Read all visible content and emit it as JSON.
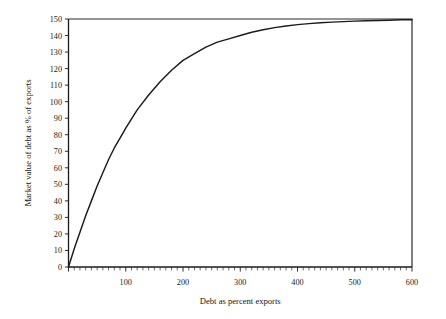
{
  "chart_data": {
    "type": "line",
    "title": "",
    "xlabel": "Debt as percent exports",
    "ylabel": "Market value of debt as % of exports",
    "xlim": [
      0,
      600
    ],
    "ylim": [
      0,
      150
    ],
    "grid": false,
    "legend_position": "none",
    "x_ticks": [
      0,
      100,
      200,
      300,
      400,
      500,
      600
    ],
    "x_tick_labels": [
      "",
      "100",
      "200",
      "300",
      "400",
      "500",
      "600"
    ],
    "x_minor_tick_step": 10,
    "y_ticks": [
      0,
      10,
      20,
      30,
      40,
      50,
      60,
      70,
      80,
      90,
      100,
      110,
      120,
      130,
      140,
      150
    ],
    "y_tick_labels": [
      "0",
      "10",
      "20",
      "30",
      "40",
      "50",
      "60",
      "70",
      "80",
      "90",
      "100",
      "110",
      "120",
      "130",
      "140",
      "150"
    ],
    "series": [
      {
        "name": "Market value of debt",
        "x": [
          0,
          10,
          20,
          30,
          40,
          50,
          60,
          70,
          80,
          90,
          100,
          120,
          140,
          160,
          180,
          200,
          220,
          240,
          260,
          280,
          300,
          320,
          340,
          360,
          380,
          400,
          420,
          440,
          460,
          480,
          500,
          520,
          540,
          560,
          580,
          600
        ],
        "values": [
          0,
          11,
          21,
          31,
          40,
          49,
          57,
          65,
          72,
          78,
          84,
          95,
          104,
          112,
          119,
          125,
          129,
          133,
          136,
          138,
          140,
          142,
          143.5,
          144.8,
          145.8,
          146.6,
          147.2,
          147.7,
          148.1,
          148.4,
          148.7,
          148.9,
          149.1,
          149.3,
          149.5,
          149.6
        ]
      }
    ],
    "asymptote": 150,
    "annotations": []
  },
  "axes": {
    "x_title": "Debt as percent exports",
    "y_title": "Market value of debt as % of exports"
  }
}
